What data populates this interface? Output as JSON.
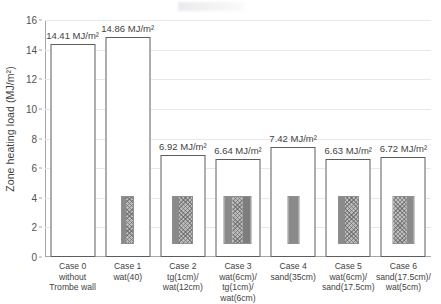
{
  "chart_data": {
    "type": "bar",
    "title": "",
    "xlabel": "",
    "ylabel": "Zone heating load (MJ/m²)",
    "ylim": [
      0,
      16
    ],
    "ytick_step": 2,
    "yticks": [
      "0",
      "2",
      "4",
      "6",
      "8",
      "10",
      "12",
      "14",
      "16"
    ],
    "grid": "horizontal",
    "legend": "none",
    "unit": "MJ/m²",
    "categories": [
      "Case 0 without Trombe wall",
      "Case 1 wat(40)",
      "Case 2 tg(1cm)/wat(12cm)",
      "Case 3 wat(6cm)/tg(1cm)/wat(6cm)",
      "Case 4 sand(35cm)",
      "Case 5 wat(6cm)/sand(17.5cm)",
      "Case 6 sand(17.5cm)/wat(5cm)"
    ],
    "values": [
      14.41,
      14.86,
      6.92,
      6.64,
      7.42,
      6.63,
      6.72
    ],
    "data_labels": [
      "14.41 MJ/m²",
      "14.86 MJ/m²",
      "6.92 MJ/m²",
      "6.64 MJ/m²",
      "7.42 MJ/m²",
      "6.63 MJ/m²",
      "6.72 MJ/m²"
    ],
    "category_lines": [
      [
        "Case 0",
        "without",
        "Trombe wall"
      ],
      [
        "Case 1",
        "wat(40)"
      ],
      [
        "Case 2",
        "tg(1cm)/",
        "wat(12cm)"
      ],
      [
        "Case 3",
        "wat(6cm)/",
        "tg(1cm)/",
        "wat(6cm)"
      ],
      [
        "Case 4",
        "sand(35cm)"
      ],
      [
        "Case 5",
        "wat(6cm)/",
        "sand(17.5cm)"
      ],
      [
        "Case 6",
        "sand(17.5cm)/",
        "wat(5cm)"
      ]
    ],
    "wall_sections": [
      {
        "width": 0,
        "layers": []
      },
      {
        "width": 11,
        "layers": [
          {
            "w": 4,
            "style": "solid"
          },
          {
            "w": 7,
            "style": "hatch"
          }
        ]
      },
      {
        "width": 19,
        "layers": [
          {
            "w": 6,
            "style": "solid"
          },
          {
            "w": 13,
            "style": "hatch"
          }
        ]
      },
      {
        "width": 26,
        "layers": [
          {
            "w": 8,
            "style": "solid"
          },
          {
            "w": 10,
            "style": "hatch"
          },
          {
            "w": 8,
            "style": "dark"
          }
        ]
      },
      {
        "width": 10,
        "layers": [
          {
            "w": 10,
            "style": "solid"
          }
        ]
      },
      {
        "width": 19,
        "layers": [
          {
            "w": 6,
            "style": "solid"
          },
          {
            "w": 13,
            "style": "hatch"
          }
        ]
      },
      {
        "width": 20,
        "layers": [
          {
            "w": 13,
            "style": "hatch"
          },
          {
            "w": 7,
            "style": "solid"
          }
        ]
      }
    ],
    "colors": {
      "bar_outline": "#5d5d5d",
      "bar_fill": "#ffffff",
      "gridline": "#e8e8e8",
      "axis": "#a6a6a6",
      "text": "#3f3f3f"
    }
  }
}
